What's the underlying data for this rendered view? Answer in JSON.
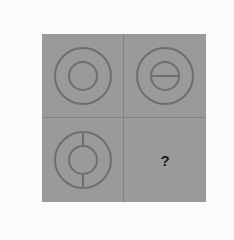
{
  "puzzle": {
    "type": "2x2 visual pattern matrix",
    "background_color": "#9a9a9a",
    "line_color": "#6f6f6f",
    "cells": [
      {
        "position": "top-left",
        "figure": "outer circle with inner circle",
        "divider": "none"
      },
      {
        "position": "top-right",
        "figure": "outer circle with inner circle",
        "divider": "horizontal line across inner circle"
      },
      {
        "position": "bottom-left",
        "figure": "outer circle with inner circle",
        "divider": "vertical lines connecting inner circle to outer circle (top and bottom)"
      },
      {
        "position": "bottom-right",
        "figure": "unknown",
        "label": "?"
      }
    ],
    "missing_label": "?"
  }
}
